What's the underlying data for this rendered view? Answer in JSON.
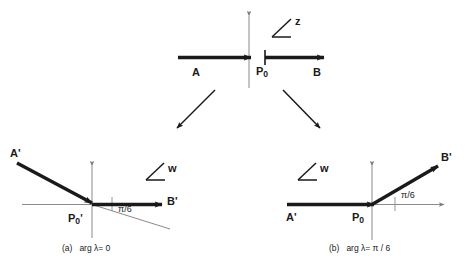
{
  "figure": {
    "title": "",
    "background_color": "#ffffff",
    "stroke_color": "#1a1a1a",
    "thin_stroke_color": "#8a8a8a"
  },
  "diagram_z": {
    "plane_label": "z",
    "angle_symbol": "∠",
    "point_left_label": "A",
    "point_right_label": "B",
    "origin_label": "P",
    "origin_subscript": "0",
    "ray_description": "horizontal ray through origin, arrowhead at origin and at right end"
  },
  "diagram_a": {
    "plane_label": "w",
    "angle_symbol": "∠",
    "point_left_label": "A'",
    "point_right_label": "B'",
    "origin_label": "P",
    "origin_subscript": "0",
    "origin_prime": "'",
    "angle_label": "π/6",
    "caption_tag": "(a)",
    "caption_text": "arg λ= 0",
    "incoming_ray_angle_deg": -30,
    "outgoing_ray_angle_deg": 0
  },
  "diagram_b": {
    "plane_label": "w",
    "angle_symbol": "∠",
    "point_left_label": "A'",
    "point_right_label": "B'",
    "origin_label": "P",
    "origin_subscript": "0",
    "angle_label": "π/6",
    "caption_tag": "(b)",
    "caption_text": "arg λ= π / 6",
    "incoming_ray_angle_deg": 0,
    "outgoing_ray_angle_deg": 30
  },
  "connectors": {
    "left_arrow": "down-left-arrow",
    "right_arrow": "down-right-arrow"
  }
}
